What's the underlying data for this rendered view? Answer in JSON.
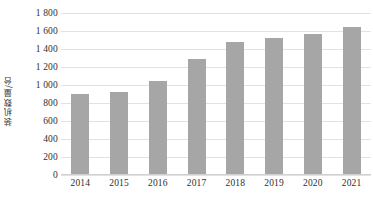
{
  "top_clipped_text": "",
  "chart_data": {
    "type": "bar",
    "title": "",
    "xlabel": "",
    "ylabel": "装机数量/台",
    "categories": [
      "2014",
      "2015",
      "2016",
      "2017",
      "2018",
      "2019",
      "2020",
      "2021"
    ],
    "values": [
      900,
      920,
      1045,
      1290,
      1480,
      1520,
      1570,
      1640
    ],
    "series": [
      {
        "name": "装机数量",
        "values": [
          900,
          920,
          1045,
          1290,
          1480,
          1520,
          1570,
          1640
        ]
      }
    ],
    "ylim": [
      0,
      1800
    ],
    "ytick_values": [
      0,
      200,
      400,
      600,
      800,
      1000,
      1200,
      1400,
      1600,
      1800
    ],
    "ytick_labels": [
      "0",
      "200",
      "400",
      "600",
      "800",
      "1 000",
      "1 200",
      "1 400",
      "1 600",
      "1 800"
    ],
    "grid": true,
    "legend": false,
    "legend_position": "none",
    "bar_color": "#a6a6a6",
    "gridline_color": "#e2e2e2",
    "axis_label_color": "#2f2f2f",
    "background_color": "#ffffff"
  }
}
